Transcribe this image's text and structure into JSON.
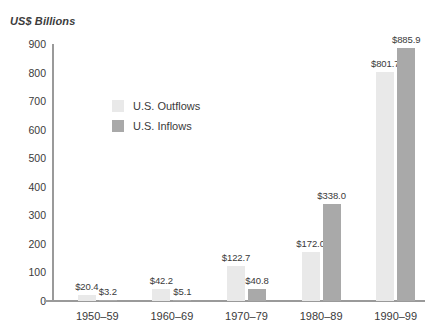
{
  "chart_data": {
    "type": "bar",
    "title": "US$ Billions",
    "xlabel": "",
    "ylabel": "US$ Billions",
    "ylim": [
      0,
      900
    ],
    "ytick_step": 100,
    "yticks": [
      900,
      800,
      700,
      600,
      500,
      400,
      300,
      200,
      100,
      0
    ],
    "grid": false,
    "legend_position": "inside-upper-left",
    "categories": [
      "1950–59",
      "1960–69",
      "1970–79",
      "1980–89",
      "1990–99"
    ],
    "series": [
      {
        "name": "U.S. Outflows",
        "color": "#e9e9e9",
        "values": [
          20.4,
          42.2,
          122.7,
          172.0,
          801.7
        ],
        "labels": [
          "$20.4",
          "$42.2",
          "$122.7",
          "$172.0",
          "$801.7"
        ]
      },
      {
        "name": "U.S. Inflows",
        "color": "#a9a9a9",
        "values": [
          3.2,
          5.1,
          40.8,
          338.0,
          885.9
        ],
        "labels": [
          "$3.2",
          "$5.1",
          "$40.8",
          "$338.0",
          "$885.9"
        ]
      }
    ]
  },
  "legend": {
    "items": [
      {
        "label": "U.S. Outflows",
        "color": "#e9e9e9"
      },
      {
        "label": "U.S. Inflows",
        "color": "#a9a9a9"
      }
    ]
  },
  "colors": {
    "axis": "#9a9a9a",
    "text": "#3a3a3a",
    "background": "#ffffff",
    "outflow": "#e9e9e9",
    "inflow": "#a9a9a9"
  }
}
